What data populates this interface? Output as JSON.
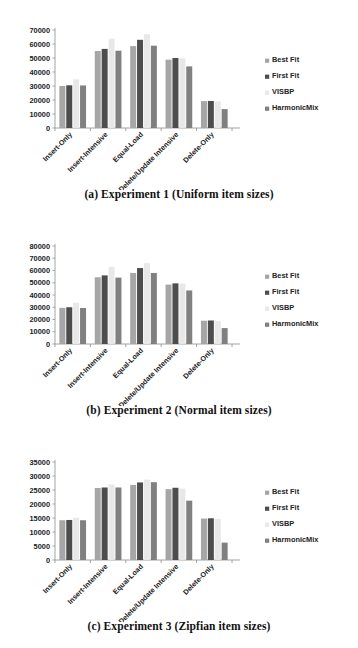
{
  "figure": {
    "series_names": [
      "Best Fit",
      "First Fit",
      "VISBP",
      "HarmonicMix"
    ],
    "series_colors": [
      "#a6a6a6",
      "#4d4d4d",
      "#e8e8e8",
      "#808080"
    ],
    "categories": [
      "Insert-Only",
      "Insert-Intensive",
      "Equal-Load",
      "Delete/Update Intensive",
      "Delete-Only"
    ]
  },
  "panels": [
    {
      "id": "panel-a",
      "caption": "(a)  Experiment 1 (Uniform item sizes)",
      "chart_data": {
        "type": "bar",
        "title": "",
        "xlabel": "",
        "ylabel": "",
        "ylim": [
          0,
          70000
        ],
        "ytick_step": 10000,
        "yticks": [
          "0",
          "10000",
          "20000",
          "30000",
          "40000",
          "50000",
          "60000",
          "70000"
        ],
        "grid": false,
        "legend_position": "right",
        "categories": [
          "Insert-Only",
          "Insert-Intensive",
          "Equal-Load",
          "Delete/Update Intensive",
          "Delete-Only"
        ],
        "series": [
          {
            "name": "Best Fit",
            "values": [
              30000,
              55000,
              58500,
              48800,
              19200
            ]
          },
          {
            "name": "First Fit",
            "values": [
              30500,
              56500,
              63000,
              50000,
              19300
            ]
          },
          {
            "name": "VISBP",
            "values": [
              34800,
              63800,
              67000,
              49800,
              19000
            ]
          },
          {
            "name": "HarmonicMix",
            "values": [
              30400,
              55200,
              58800,
              44000,
              13500
            ]
          }
        ]
      }
    },
    {
      "id": "panel-b",
      "caption": "(b)  Experiment 2 (Normal item sizes)",
      "chart_data": {
        "type": "bar",
        "title": "",
        "xlabel": "",
        "ylabel": "",
        "ylim": [
          0,
          80000
        ],
        "ytick_step": 10000,
        "yticks": [
          "0",
          "10000",
          "20000",
          "30000",
          "40000",
          "50000",
          "60000",
          "70000",
          "80000"
        ],
        "grid": false,
        "legend_position": "right",
        "categories": [
          "Insert-Only",
          "Insert-Intensive",
          "Equal-Load",
          "Delete/Update Intensive",
          "Delete-Only"
        ],
        "series": [
          {
            "name": "Best Fit",
            "values": [
              29500,
              54500,
              58000,
              48500,
              19000
            ]
          },
          {
            "name": "First Fit",
            "values": [
              30000,
              56000,
              62000,
              49500,
              19200
            ]
          },
          {
            "name": "VISBP",
            "values": [
              33800,
              63000,
              66000,
              49300,
              18800
            ]
          },
          {
            "name": "HarmonicMix",
            "values": [
              29400,
              54200,
              58000,
              43700,
              13000
            ]
          }
        ]
      }
    },
    {
      "id": "panel-c",
      "caption": "(c)  Experiment 3 (Zipfian item sizes)",
      "chart_data": {
        "type": "bar",
        "title": "",
        "xlabel": "",
        "ylabel": "",
        "ylim": [
          0,
          35000
        ],
        "ytick_step": 5000,
        "yticks": [
          "0",
          "5000",
          "10000",
          "15000",
          "20000",
          "25000",
          "30000",
          "35000"
        ],
        "grid": false,
        "legend_position": "right",
        "categories": [
          "Insert-Only",
          "Insert-Intensive",
          "Equal-Load",
          "Delete/Update Intensive",
          "Delete-Only"
        ],
        "series": [
          {
            "name": "Best Fit",
            "values": [
              14200,
              25700,
              26800,
              25300,
              14800
            ]
          },
          {
            "name": "First Fit",
            "values": [
              14300,
              25900,
              27700,
              25800,
              14900
            ]
          },
          {
            "name": "VISBP",
            "values": [
              15100,
              27000,
              28700,
              25500,
              14700
            ]
          },
          {
            "name": "HarmonicMix",
            "values": [
              14200,
              25900,
              27800,
              21200,
              6200
            ]
          }
        ]
      }
    }
  ]
}
